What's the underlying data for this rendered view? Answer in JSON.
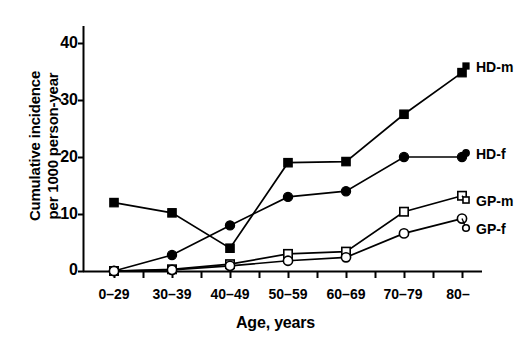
{
  "chart_data": {
    "type": "line",
    "title": "",
    "xlabel": "Age, years",
    "ylabel_line1": "Cumulative incidence",
    "ylabel_line2": "per 1000 person-year",
    "categories": [
      "0–29",
      "30–39",
      "40–49",
      "50–59",
      "60–69",
      "70–79",
      "80–"
    ],
    "yticks": [
      "0",
      "10",
      "20",
      "30",
      "40"
    ],
    "ytick_values": [
      0,
      10,
      20,
      30,
      40
    ],
    "ylim": [
      0,
      44
    ],
    "grid": false,
    "legend_position": "right-of-plot-at-series-end",
    "series": [
      {
        "name": "HD-m",
        "marker": "filled-square",
        "color": "#000000",
        "values": [
          12.0,
          10.2,
          4.0,
          19.0,
          19.2,
          27.5,
          34.8
        ]
      },
      {
        "name": "HD-f",
        "marker": "filled-circle",
        "color": "#000000",
        "values": [
          0.0,
          2.8,
          8.0,
          13.0,
          14.0,
          20.0,
          20.0
        ]
      },
      {
        "name": "GP-m",
        "marker": "open-square",
        "color": "#000000",
        "values": [
          0.0,
          0.3,
          1.2,
          3.0,
          3.4,
          10.4,
          13.2
        ]
      },
      {
        "name": "GP-f",
        "marker": "open-circle",
        "color": "#000000",
        "values": [
          0.0,
          0.2,
          0.9,
          1.8,
          2.4,
          6.6,
          9.2
        ]
      }
    ]
  },
  "legend": {
    "entries": [
      {
        "label": "HD-m"
      },
      {
        "label": "HD-f"
      },
      {
        "label": "GP-m"
      },
      {
        "label": "GP-f"
      }
    ]
  }
}
